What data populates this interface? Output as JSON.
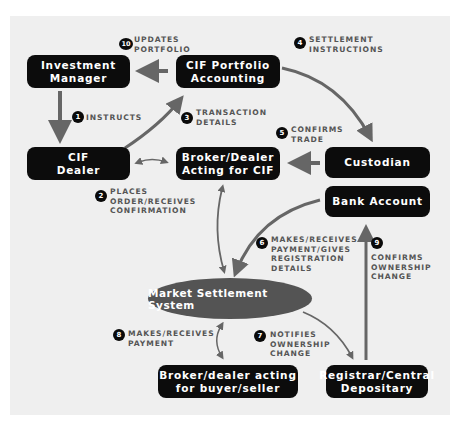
{
  "colors": {
    "background": "#efefef",
    "node_fill": "#0c0c0c",
    "ellipse_fill": "#545454",
    "arrow": "#666666",
    "label_text": "#555555"
  },
  "nodes": {
    "investment_manager": {
      "line1": "Investment",
      "line2": "Manager"
    },
    "cif_portfolio_accounting": {
      "line1": "CIF Portfolio",
      "line2": "Accounting"
    },
    "cif_dealer": {
      "line1": "CIF",
      "line2": "Dealer"
    },
    "broker_dealer_cif": {
      "line1": "Broker/Dealer",
      "line2": "Acting for CIF"
    },
    "custodian": {
      "line1": "Custodian"
    },
    "bank_account": {
      "line1": "Bank Account"
    },
    "market_settlement_system": {
      "line1": "Market Settlement System"
    },
    "broker_dealer_buyer_seller": {
      "line1": "Broker/dealer acting",
      "line2": "for buyer/seller"
    },
    "registrar": {
      "line1": "Registrar/Central",
      "line2": "Depositary"
    }
  },
  "steps": [
    {
      "num": "1",
      "lines": [
        "INSTRUCTS"
      ]
    },
    {
      "num": "2",
      "lines": [
        "PLACES",
        "ORDER/RECEIVES",
        "CONFIRMATION"
      ]
    },
    {
      "num": "3",
      "lines": [
        "TRANSACTION",
        "DETAILS"
      ]
    },
    {
      "num": "4",
      "lines": [
        "SETTLEMENT",
        "INSTRUCTIONS"
      ]
    },
    {
      "num": "5",
      "lines": [
        "CONFIRMS",
        "TRADE"
      ]
    },
    {
      "num": "6",
      "lines": [
        "MAKES/RECEIVES",
        "PAYMENT/GIVES",
        "REGISTRATION",
        "DETAILS"
      ]
    },
    {
      "num": "7",
      "lines": [
        "NOTIFIES",
        "OWNERSHIP",
        "CHANGE"
      ]
    },
    {
      "num": "8",
      "lines": [
        "MAKES/RECEIVES",
        "PAYMENT"
      ]
    },
    {
      "num": "9",
      "lines": [
        "CONFIRMS",
        "OWNERSHIP",
        "CHANGE"
      ]
    },
    {
      "num": "10",
      "lines": [
        "UPDATES",
        "PORTFOLIO"
      ]
    }
  ]
}
